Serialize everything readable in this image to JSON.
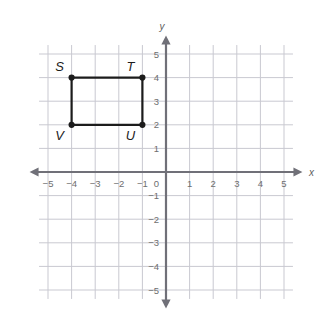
{
  "figure": {
    "background_color": "#ffffff",
    "grid_color": "#c9c9d1",
    "axis_color": "#707078",
    "shape_color": "#1c1c1c",
    "tick_label_color": "#6e6e6e"
  },
  "axes": {
    "x_name": "x",
    "y_name": "y",
    "origin_label": "0",
    "x_min": -5,
    "x_max": 5,
    "y_min": -5,
    "y_max": 5,
    "step": 1,
    "x_tick_labels": [
      "−5",
      "−4",
      "−3",
      "−2",
      "−1",
      "1",
      "2",
      "3",
      "4",
      "5"
    ],
    "y_tick_labels": [
      "5",
      "4",
      "3",
      "2",
      "1",
      "−1",
      "−2",
      "−3",
      "−4",
      "−5"
    ],
    "x_tick_values": [
      -5,
      -4,
      -3,
      -2,
      -1,
      1,
      2,
      3,
      4,
      5
    ],
    "y_tick_values": [
      5,
      4,
      3,
      2,
      1,
      -1,
      -2,
      -3,
      -4,
      -5
    ],
    "arrows": [
      "left",
      "right",
      "up",
      "down"
    ],
    "grid_visible": true
  },
  "chart_data": {
    "type": "scatter",
    "xlabel": "x",
    "ylabel": "y",
    "xlim": [
      -5,
      5
    ],
    "ylim": [
      -5,
      5
    ],
    "grid": true,
    "legend": "none",
    "shapes": [
      {
        "name": "rectangle-stuv",
        "kind": "polygon",
        "closed": true,
        "label_order": "S, T, U, V",
        "points": [
          {
            "label": "S",
            "x": -4,
            "y": 4,
            "label_position": "above-left"
          },
          {
            "label": "T",
            "x": -1,
            "y": 4,
            "label_position": "above-left"
          },
          {
            "label": "U",
            "x": -1,
            "y": 2,
            "label_position": "below-left"
          },
          {
            "label": "V",
            "x": -4,
            "y": 2,
            "label_position": "below-left"
          }
        ],
        "width_units": 3,
        "height_units": 2
      }
    ],
    "vertices": [
      {
        "label": "S",
        "x": -4,
        "y": 4
      },
      {
        "label": "T",
        "x": -1,
        "y": 4
      },
      {
        "label": "U",
        "x": -1,
        "y": 2
      },
      {
        "label": "V",
        "x": -4,
        "y": 2
      }
    ]
  }
}
